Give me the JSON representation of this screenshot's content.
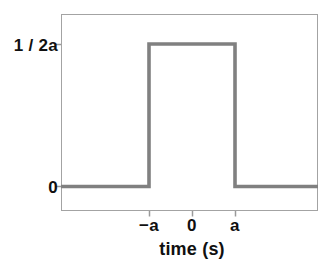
{
  "chart_data": {
    "type": "line",
    "title": "",
    "subtitle": "",
    "xlabel": "time (s)",
    "ylabel": "",
    "grid": false,
    "legend": null,
    "x": [
      "-inf",
      "-a",
      "-a",
      "a",
      "a",
      "+inf"
    ],
    "y": [
      0,
      0,
      "1 / 2a",
      "1 / 2a",
      0,
      0
    ],
    "series": [
      {
        "name": "rect pulse",
        "color": "#808080",
        "points": [
          {
            "x": "-inf",
            "y": 0
          },
          {
            "x": "-a",
            "y": 0
          },
          {
            "x": "-a",
            "y": "1 / 2a"
          },
          {
            "x": "a",
            "y": "1 / 2a"
          },
          {
            "x": "a",
            "y": 0
          },
          {
            "x": "+inf",
            "y": 0
          }
        ]
      }
    ],
    "xticks": [
      {
        "value": "-a",
        "label": "−a"
      },
      {
        "value": "0",
        "label": "0"
      },
      {
        "value": "a",
        "label": "a"
      }
    ],
    "yticks": [
      {
        "value": "0",
        "label": "0"
      },
      {
        "value": "1/2a",
        "label": "1 / 2a"
      }
    ],
    "xlim": [
      "below -a",
      "above a"
    ],
    "ylim": [
      "0",
      "above 1/2a"
    ]
  },
  "axes": {
    "x_title": "time (s)",
    "y_tick_top_label": "1 / 2a",
    "y_tick_zero_label": "0",
    "x_tick_neg_a_label": "−a",
    "x_tick_zero_label": "0",
    "x_tick_pos_a_label": "a"
  },
  "colors": {
    "signal": "#808080",
    "frame": "#a3a3a3",
    "tick": "#9a9a9a",
    "text": "#101010",
    "background": "#ffffff"
  }
}
